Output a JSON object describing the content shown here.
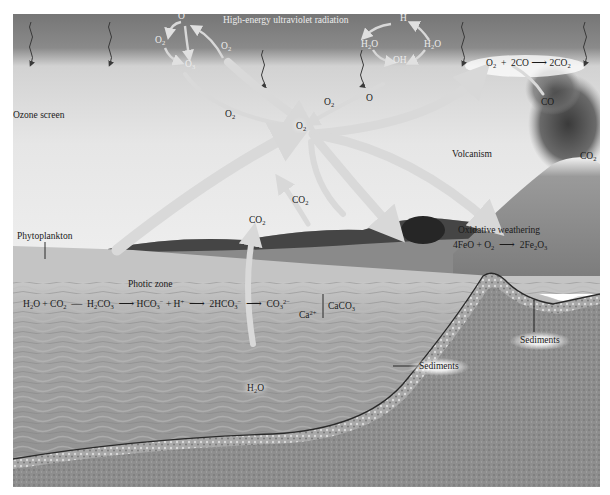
{
  "diagram": {
    "type": "oxygen-cycle-illustration",
    "labels": {
      "uv_radiation": "High-energy ultraviolet radiation",
      "ozone_screen": "Ozone screen",
      "phytoplankton": "Phytoplankton",
      "photic_zone": "Photic zone",
      "volcanism": "Volcanism",
      "oxidative_weathering": "Oxidative weathering",
      "sediments_right": "Sediments",
      "sediments_middle": "Sediments"
    },
    "ozone_cycle": {
      "species": [
        "O",
        "O2",
        "O3",
        "O2"
      ]
    },
    "water_photolysis": {
      "species": [
        "H",
        "H2O",
        "H2O",
        "OH",
        "O"
      ]
    },
    "reactions": {
      "co_oxidation": {
        "reactants": "O2 + 2CO",
        "products": "2CO2"
      },
      "weathering": {
        "reactants": "4FeO + O2",
        "products": "2Fe2O3"
      },
      "carbonate": {
        "steps": [
          "H2O + CO2",
          "H2CO3",
          "HCO3- + H+",
          "2HCO3-",
          "CO3 2-"
        ],
        "calcium": "Ca2+",
        "product": "CaCO3"
      }
    },
    "species_labels": {
      "central_o2": "O2",
      "o2_left": "O2",
      "o2_right": "O2",
      "o_atom": "O",
      "co_volcano": "CO",
      "co2_volcano": "CO2",
      "co2_land": "CO2",
      "co2_ocean": "CO2",
      "h2o_ocean": "H2O"
    },
    "colors": {
      "sky_dark": "#7c7c7c",
      "sky_light": "#e4e4e4",
      "arrow": "#d6d6d6",
      "ocean": "#9a9a9a",
      "sediment": "#6e6e6e",
      "label_dark": "#1a1a1a",
      "label_light": "#ececec"
    }
  }
}
